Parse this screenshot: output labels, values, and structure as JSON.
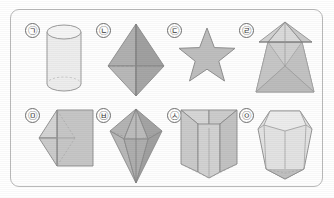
{
  "panel": {
    "name": "geometry-solids-figure",
    "border_color": "#b9b9b9",
    "background_color": "#fefefe"
  },
  "palette": {
    "outline": "#8a8a8a",
    "fill_light": "#dcdcdc",
    "fill_mid": "#c4c4c4",
    "fill_dark": "#a8a8a8",
    "fill_pale": "#ededed",
    "hidden_edge": "#bdbdbd",
    "label_text": "#3a3a3a",
    "label_ring": "#6e6e6e"
  },
  "items": [
    {
      "label": "㉠",
      "label_reading": "g",
      "shape_name": "cylinder",
      "row": 1,
      "column": 1,
      "shading": "pale",
      "description": "Upright circular cylinder with visible top ellipse and dashed hidden bottom ellipse"
    },
    {
      "label": "㉡",
      "label_reading": "n",
      "shape_name": "octahedron",
      "row": 1,
      "column": 2,
      "shading": "dark",
      "description": "Tall square bipyramid (octahedron) seen from the side"
    },
    {
      "label": "㉢",
      "label_reading": "d",
      "shape_name": "five-pointed-star",
      "row": 1,
      "column": 3,
      "shading": "mid",
      "description": "Flat five-pointed star outline"
    },
    {
      "label": "㉣",
      "label_reading": "r",
      "shape_name": "pyramid-on-frustum",
      "row": 1,
      "column": 4,
      "shading": "light",
      "description": "Square frustum topped by a square pyramid"
    },
    {
      "label": "㉤",
      "label_reading": "m",
      "shape_name": "cube-with-pyramid",
      "row": 2,
      "column": 1,
      "shading": "mid",
      "description": "Cube with a square pyramid attached on the left face"
    },
    {
      "label": "㉥",
      "label_reading": "b",
      "shape_name": "elongated-bipyramid",
      "row": 2,
      "column": 2,
      "shading": "dark",
      "description": "Gem-like elongated bipyramid with a long lower point"
    },
    {
      "label": "㉦",
      "label_reading": "s",
      "shape_name": "triangular-prism",
      "row": 2,
      "column": 3,
      "shading": "light",
      "description": "Upright triangular prism standing on one edge"
    },
    {
      "label": "㉧",
      "label_reading": "ng",
      "shape_name": "hexagonal-prism",
      "row": 2,
      "column": 4,
      "shading": "pale",
      "description": "Tapered hexagonal prism resembling a cut gemstone"
    }
  ]
}
